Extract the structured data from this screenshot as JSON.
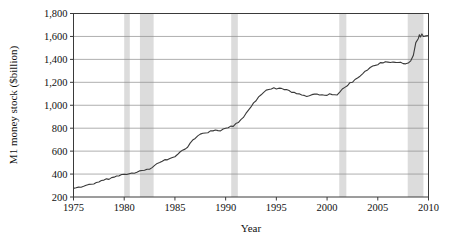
{
  "chart_data": {
    "type": "line",
    "title": "",
    "xlabel": "Year",
    "ylabel": "M1 money stock ($billion)",
    "xlim": [
      1975,
      2010
    ],
    "ylim": [
      200,
      1800
    ],
    "xticks": [
      1975,
      1980,
      1985,
      1990,
      1995,
      2000,
      2005,
      2010
    ],
    "xtick_labels": [
      "1975",
      "1980",
      "1985",
      "1990",
      "1995",
      "2000",
      "2005",
      "2010"
    ],
    "yticks": [
      200,
      400,
      600,
      800,
      1000,
      1200,
      1400,
      1600,
      1800
    ],
    "ytick_labels": [
      "200",
      "400",
      "600",
      "800",
      "1,000",
      "1,200",
      "1,400",
      "1,600",
      "1,800"
    ],
    "grid": "horizontal",
    "legend": "none",
    "line_color": "#3a3a3a",
    "shaded_band_color": "#dcdcdc",
    "shaded_bands": [
      {
        "label": "1980 recession",
        "start": 1980.0,
        "end": 1980.55
      },
      {
        "label": "1981-82 recession",
        "start": 1981.55,
        "end": 1982.9
      },
      {
        "label": "1990-91 recession",
        "start": 1990.55,
        "end": 1991.2
      },
      {
        "label": "2001 recession",
        "start": 2001.2,
        "end": 2001.9
      },
      {
        "label": "2007-09 recession",
        "start": 2007.95,
        "end": 2009.5
      }
    ],
    "series": [
      {
        "name": "M1 money stock",
        "x": [
          1975.0,
          1975.25,
          1975.5,
          1975.75,
          1976.0,
          1976.25,
          1976.5,
          1976.75,
          1977.0,
          1977.25,
          1977.5,
          1977.75,
          1978.0,
          1978.25,
          1978.5,
          1978.75,
          1979.0,
          1979.25,
          1979.5,
          1979.75,
          1980.0,
          1980.25,
          1980.5,
          1980.75,
          1981.0,
          1981.25,
          1981.5,
          1981.75,
          1982.0,
          1982.25,
          1982.5,
          1982.75,
          1983.0,
          1983.25,
          1983.5,
          1983.75,
          1984.0,
          1984.25,
          1984.5,
          1984.75,
          1985.0,
          1985.25,
          1985.5,
          1985.75,
          1986.0,
          1986.25,
          1986.5,
          1986.75,
          1987.0,
          1987.25,
          1987.5,
          1987.75,
          1988.0,
          1988.25,
          1988.5,
          1988.75,
          1989.0,
          1989.25,
          1989.5,
          1989.75,
          1990.0,
          1990.25,
          1990.5,
          1990.75,
          1991.0,
          1991.25,
          1991.5,
          1991.75,
          1992.0,
          1992.25,
          1992.5,
          1992.75,
          1993.0,
          1993.25,
          1993.5,
          1993.75,
          1994.0,
          1994.25,
          1994.5,
          1994.75,
          1995.0,
          1995.25,
          1995.5,
          1995.75,
          1996.0,
          1996.25,
          1996.5,
          1996.75,
          1997.0,
          1997.25,
          1997.5,
          1997.75,
          1998.0,
          1998.25,
          1998.5,
          1998.75,
          1999.0,
          1999.25,
          1999.5,
          1999.75,
          2000.0,
          2000.25,
          2000.5,
          2000.75,
          2001.0,
          2001.25,
          2001.5,
          2001.75,
          2002.0,
          2002.25,
          2002.5,
          2002.75,
          2003.0,
          2003.25,
          2003.5,
          2003.75,
          2004.0,
          2004.25,
          2004.5,
          2004.75,
          2005.0,
          2005.25,
          2005.5,
          2005.75,
          2006.0,
          2006.25,
          2006.5,
          2006.75,
          2007.0,
          2007.25,
          2007.5,
          2007.75,
          2008.0,
          2008.25,
          2008.5,
          2008.75,
          2009.0,
          2009.1,
          2009.2,
          2009.35,
          2009.5,
          2009.75,
          2010.0
        ],
        "values": [
          275,
          280,
          286,
          292,
          297,
          302,
          308,
          314,
          320,
          327,
          333,
          340,
          346,
          353,
          359,
          365,
          372,
          378,
          384,
          390,
          396,
          392,
          398,
          408,
          414,
          420,
          424,
          428,
          434,
          440,
          448,
          462,
          476,
          488,
          498,
          508,
          520,
          528,
          536,
          545,
          556,
          570,
          586,
          604,
          622,
          640,
          664,
          690,
          716,
          738,
          750,
          752,
          754,
          762,
          772,
          780,
          786,
          784,
          782,
          786,
          794,
          804,
          812,
          822,
          834,
          848,
          870,
          896,
          925,
          955,
          985,
          1015,
          1045,
          1072,
          1095,
          1112,
          1128,
          1140,
          1148,
          1150,
          1148,
          1145,
          1142,
          1138,
          1132,
          1125,
          1118,
          1110,
          1102,
          1094,
          1086,
          1080,
          1078,
          1082,
          1086,
          1092,
          1096,
          1094,
          1090,
          1086,
          1090,
          1096,
          1092,
          1090,
          1096,
          1110,
          1145,
          1155,
          1175,
          1192,
          1205,
          1220,
          1238,
          1258,
          1275,
          1292,
          1310,
          1325,
          1338,
          1348,
          1358,
          1366,
          1372,
          1374,
          1376,
          1372,
          1370,
          1368,
          1372,
          1370,
          1366,
          1362,
          1368,
          1388,
          1430,
          1540,
          1580,
          1615,
          1596,
          1622,
          1600,
          1605,
          1608
        ]
      }
    ],
    "annotations": [
      {
        "text": "Shaded vertical bands mark recession periods"
      }
    ]
  }
}
